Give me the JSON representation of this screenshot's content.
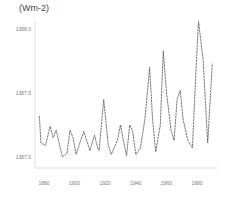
{
  "chart_data": {
    "type": "line",
    "title": "",
    "xlabel": "",
    "ylabel": "(Wm-2)",
    "xlim": [
      1875,
      1992
    ],
    "ylim": [
      1366.9,
      1368.1
    ],
    "x_ticks": [
      1880,
      1900,
      1920,
      1940,
      1960,
      1980
    ],
    "y_ticks": [
      {
        "value": 1368.0,
        "label": "1368.0"
      },
      {
        "value": 1367.5,
        "label": "1367.5"
      },
      {
        "value": 1367.0,
        "label": "1367.0"
      }
    ],
    "grid": false,
    "legend": null,
    "series": [
      {
        "name": "Solar irradiance",
        "color": "#555555",
        "x": [
          1877,
          1878,
          1881,
          1884,
          1886,
          1888,
          1892,
          1895,
          1897,
          1899,
          1901,
          1904,
          1906,
          1907,
          1910,
          1913,
          1915,
          1916,
          1919,
          1922,
          1924,
          1928,
          1930,
          1932,
          1934,
          1936,
          1938,
          1940,
          1943,
          1946,
          1949,
          1951,
          1953,
          1956,
          1958,
          1960,
          1963,
          1965,
          1967,
          1969,
          1971,
          1974,
          1977,
          1979,
          1981,
          1984,
          1987,
          1990
        ],
        "values": [
          1367.32,
          1367.11,
          1367.09,
          1367.24,
          1367.15,
          1367.21,
          1367.0,
          1367.03,
          1367.21,
          1367.15,
          1367.02,
          1367.13,
          1367.2,
          1367.16,
          1367.05,
          1367.17,
          1367.07,
          1367.05,
          1367.45,
          1367.09,
          1367.02,
          1367.13,
          1367.25,
          1367.12,
          1367.01,
          1367.25,
          1367.2,
          1367.02,
          1367.07,
          1367.3,
          1367.7,
          1367.29,
          1367.04,
          1367.25,
          1367.83,
          1367.51,
          1367.21,
          1367.13,
          1367.45,
          1367.52,
          1367.29,
          1367.13,
          1367.07,
          1367.6,
          1368.06,
          1367.76,
          1367.11,
          1367.73
        ]
      }
    ]
  }
}
